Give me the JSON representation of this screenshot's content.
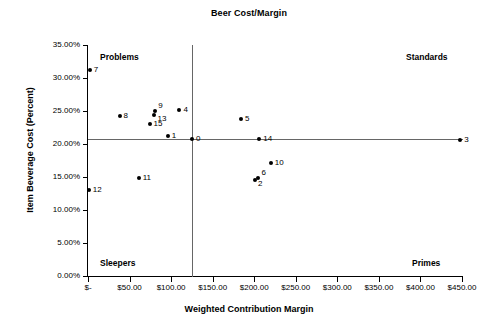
{
  "chart_data": {
    "type": "scatter",
    "title": "Beer Cost/Margin",
    "xlabel": "Weighted Contribution Margin",
    "ylabel": "Item Beverage Cost (Percent)",
    "xlim": [
      0,
      450
    ],
    "ylim": [
      0,
      35
    ],
    "grid": false,
    "legend": "none",
    "x_tick_labels": [
      "$-",
      "$50.00",
      "$100.00",
      "$150.00",
      "$200.00",
      "$250.00",
      "$300.00",
      "$350.00",
      "$400.00",
      "$450.00"
    ],
    "x_tick_values": [
      0,
      50,
      100,
      150,
      200,
      250,
      300,
      350,
      400,
      450
    ],
    "y_tick_labels": [
      "0.00%",
      "5.00%",
      "10.00%",
      "15.00%",
      "20.00%",
      "25.00%",
      "30.00%",
      "35.00%"
    ],
    "y_tick_values": [
      0,
      5,
      10,
      15,
      20,
      25,
      30,
      35
    ],
    "reference_lines": {
      "vertical_x": 125,
      "horizontal_y": 20.8
    },
    "quadrant_labels": [
      {
        "name": "Problems",
        "position": "top-left"
      },
      {
        "name": "Standards",
        "position": "top-right"
      },
      {
        "name": "Sleepers",
        "position": "bottom-left"
      },
      {
        "name": "Primes",
        "position": "bottom-right"
      }
    ],
    "points": [
      {
        "label": "7",
        "x": 2,
        "y": 31.2,
        "label_side": "right"
      },
      {
        "label": "8",
        "x": 38,
        "y": 24.3,
        "label_side": "right"
      },
      {
        "label": "9",
        "x": 81,
        "y": 25.0,
        "label_side": "above-right"
      },
      {
        "label": "13",
        "x": 80,
        "y": 24.4,
        "label_side": "below-right"
      },
      {
        "label": "15",
        "x": 74,
        "y": 23.0,
        "label_side": "right"
      },
      {
        "label": "4",
        "x": 110,
        "y": 25.2,
        "label_side": "right"
      },
      {
        "label": "1",
        "x": 96,
        "y": 21.2,
        "label_side": "right"
      },
      {
        "label": "0",
        "x": 125,
        "y": 20.8,
        "label_side": "right"
      },
      {
        "label": "5",
        "x": 184,
        "y": 23.8,
        "label_side": "right"
      },
      {
        "label": "14",
        "x": 206,
        "y": 20.8,
        "label_side": "right"
      },
      {
        "label": "3",
        "x": 448,
        "y": 20.6,
        "label_side": "right"
      },
      {
        "label": "10",
        "x": 220,
        "y": 17.1,
        "label_side": "right"
      },
      {
        "label": "6",
        "x": 205,
        "y": 14.9,
        "label_side": "above-right"
      },
      {
        "label": "2",
        "x": 201,
        "y": 14.6,
        "label_side": "below-right"
      },
      {
        "label": "11",
        "x": 61,
        "y": 14.9,
        "label_side": "right"
      },
      {
        "label": "12",
        "x": 1,
        "y": 13.0,
        "label_side": "right"
      }
    ]
  }
}
